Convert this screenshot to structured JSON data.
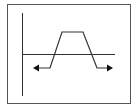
{
  "diagram": {
    "type": "trapezoidal-pulse-waveform",
    "colors": {
      "stroke": "#333333",
      "frame": "#555555",
      "background": "#ffffff"
    },
    "frame": {
      "x": 7,
      "y": 4,
      "width": 123,
      "height": 99
    },
    "vertical_axis": {
      "x": 22,
      "y1": 13,
      "y2": 96
    },
    "baseline": {
      "y": 54,
      "x1": 22,
      "x2": 115
    },
    "waveform": {
      "points": [
        [
          38,
          68
        ],
        [
          50,
          68
        ],
        [
          62,
          32
        ],
        [
          83,
          32
        ],
        [
          97,
          68
        ],
        [
          108,
          68
        ]
      ],
      "left_arrow": {
        "tip": [
          33,
          68
        ],
        "direction": "left"
      },
      "right_arrow": {
        "tip": [
          113,
          68
        ],
        "direction": "right"
      }
    }
  }
}
